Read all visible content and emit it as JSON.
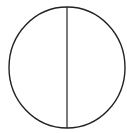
{
  "diagram": {
    "type": "circle-with-vertical-diameter",
    "stroke_color": "#222222",
    "background": "#ffffff",
    "circle": {
      "cx": 67,
      "cy": 67.5,
      "rx": 58,
      "ry": 60.5,
      "stroke_width": 1.4
    },
    "diameter": {
      "x1": 67,
      "y1": 7,
      "x2": 67,
      "y2": 128,
      "stroke_width": 1.2
    }
  }
}
